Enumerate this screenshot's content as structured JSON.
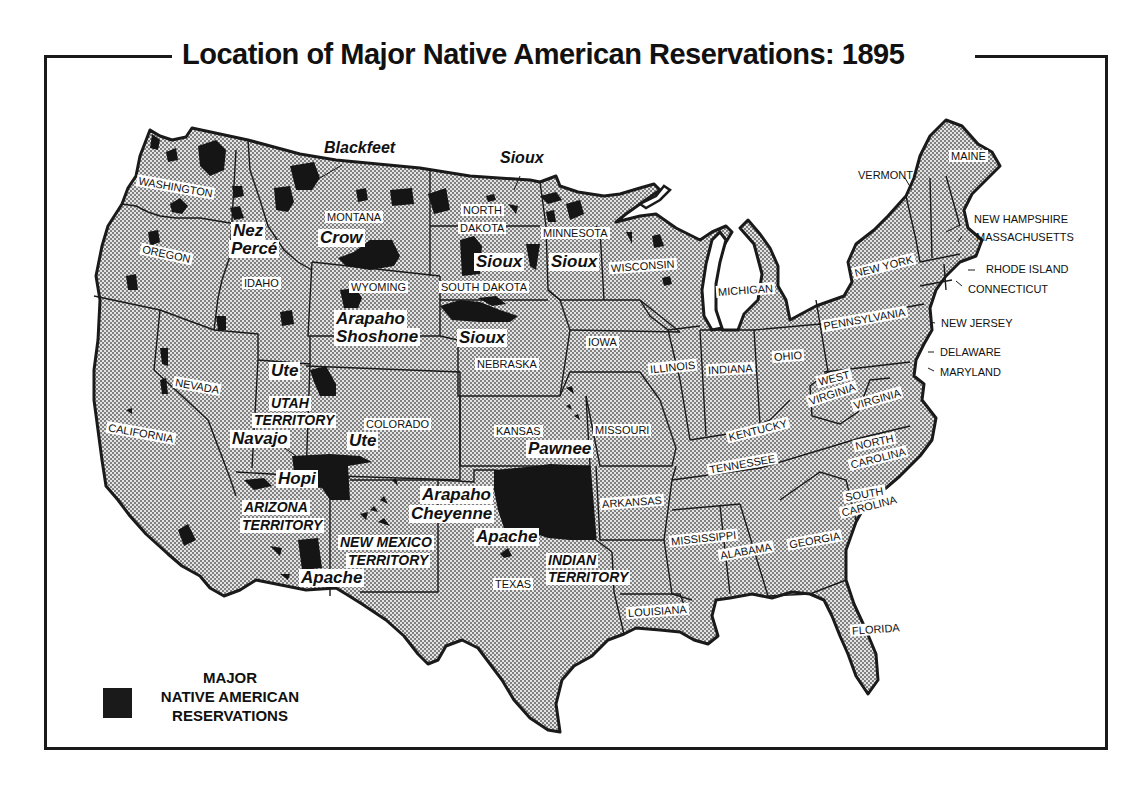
{
  "title": "Location of Major Native American Reservations: 1895",
  "colors": {
    "land_fill": "#d6d6d6",
    "dot_pattern": "#5a5a5a",
    "reservation": "#151515",
    "border": "#1a1a1a",
    "background": "#ffffff"
  },
  "legend": {
    "line1": "MAJOR",
    "line2": "NATIVE AMERICAN",
    "line3": "RESERVATIONS",
    "swatch": "reservation-black-square"
  },
  "states": {
    "washington": "WASHINGTON",
    "oregon": "OREGON",
    "california": "CALIFORNIA",
    "nevada": "NEVADA",
    "idaho": "IDAHO",
    "montana": "MONTANA",
    "wyoming": "WYOMING",
    "colorado": "COLORADO",
    "north_dakota_1": "NORTH",
    "north_dakota_2": "DAKOTA",
    "south_dakota": "SOUTH DAKOTA",
    "nebraska": "NEBRASKA",
    "kansas": "KANSAS",
    "texas": "TEXAS",
    "minnesota": "MINNESOTA",
    "iowa": "IOWA",
    "missouri": "MISSOURI",
    "arkansas": "ARKANSAS",
    "louisiana": "LOUISIANA",
    "wisconsin": "WISCONSIN",
    "illinois": "ILLINOIS",
    "michigan": "MICHIGAN",
    "indiana": "INDIANA",
    "ohio": "OHIO",
    "kentucky": "KENTUCKY",
    "tennessee": "TENNESSEE",
    "mississippi": "MISSISSIPPI",
    "alabama": "ALABAMA",
    "georgia": "GEORGIA",
    "florida": "FLORIDA",
    "south_carolina_1": "SOUTH",
    "south_carolina_2": "CAROLINA",
    "north_carolina_1": "NORTH",
    "north_carolina_2": "CAROLINA",
    "virginia": "VIRGINIA",
    "west_virginia_1": "WEST",
    "west_virginia_2": "VIRGINIA",
    "pennsylvania": "PENNSYLVANIA",
    "new_york": "NEW YORK",
    "vermont": "VERMONT",
    "maine": "MAINE",
    "new_hampshire": "NEW HAMPSHIRE",
    "massachusetts": "MASSACHUSETTS",
    "rhode_island": "RHODE ISLAND",
    "connecticut": "CONNECTICUT",
    "new_jersey": "NEW JERSEY",
    "delaware": "DELAWARE",
    "maryland": "MARYLAND"
  },
  "territories": {
    "utah_1": "UTAH",
    "utah_2": "TERRITORY",
    "arizona_1": "ARIZONA",
    "arizona_2": "TERRITORY",
    "new_mexico_1": "NEW MEXICO",
    "new_mexico_2": "TERRITORY",
    "indian_1": "INDIAN",
    "indian_2": "TERRITORY"
  },
  "tribes": {
    "blackfeet": "Blackfeet",
    "sioux_nd": "Sioux",
    "nez_perce_1": "Nez",
    "nez_perce_2": "Percé",
    "crow": "Crow",
    "sioux_sd": "Sioux",
    "sioux_mn": "Sioux",
    "arapaho_shoshone_1": "Arapaho",
    "arapaho_shoshone_2": "Shoshone",
    "sioux_ne": "Sioux",
    "ute_ut": "Ute",
    "navajo": "Navajo",
    "ute_co": "Ute",
    "hopi": "Hopi",
    "apache_az": "Apache",
    "pawnee": "Pawnee",
    "arapaho_cheyenne_1": "Arapaho",
    "arapaho_cheyenne_2": "Cheyenne",
    "apache_ok": "Apache"
  }
}
